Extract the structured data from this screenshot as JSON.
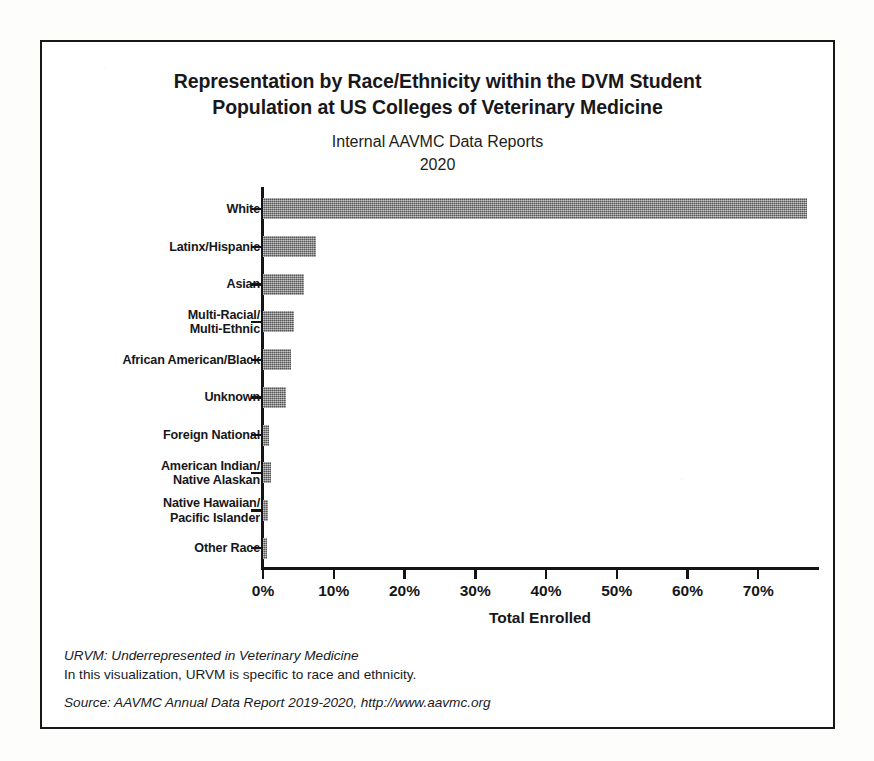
{
  "figure": {
    "title_lines": [
      "Representation by Race/Ethnicity within the DVM Student",
      "Population at US Colleges of Veterinary Medicine"
    ],
    "subtitle_lines": [
      "Internal AAVMC Data Reports",
      "2020"
    ],
    "footnotes": {
      "urvm_definition": "URVM: Underrepresented in Veterinary Medicine",
      "urvm_note": "In this visualization, URVM is specific to race and ethnicity.",
      "source": "Source: AAVMC Annual Data Report 2019-2020, http://www.aavmc.org"
    },
    "colors": {
      "bar_fill": "#8d8d8d",
      "axis": "#141417",
      "frame": "#17171a",
      "background": "#ffffff",
      "text": "#18181b"
    }
  },
  "chart_data": {
    "type": "bar",
    "orientation": "horizontal",
    "title": "Representation by Race/Ethnicity within the DVM Student Population at US Colleges of Veterinary Medicine",
    "subtitle": "Internal AAVMC Data Reports 2020",
    "xlabel": "Total Enrolled",
    "ylabel": "",
    "xlim": [
      0,
      78.6
    ],
    "xticks": [
      0,
      10,
      20,
      30,
      40,
      50,
      60,
      70
    ],
    "xtick_labels": [
      "0%",
      "10%",
      "20%",
      "30%",
      "40%",
      "50%",
      "60%",
      "70%"
    ],
    "grid": false,
    "legend": false,
    "value_suffix": "%",
    "categories": [
      "White",
      "Latinx/Hispanic",
      "Asian",
      "Multi-Racial/\nMulti-Ethnic",
      "African American/Black",
      "Unknown",
      "Foreign National",
      "American Indian/\nNative Alaskan",
      "Native Hawaiian/\nPacific Islander",
      "Other Race"
    ],
    "values": [
      76.9,
      7.5,
      5.8,
      4.4,
      3.9,
      3.2,
      0.9,
      1.1,
      0.7,
      0.6
    ],
    "bars": [
      {
        "label_lines": [
          "White"
        ],
        "value": 76.9
      },
      {
        "label_lines": [
          "Latinx/Hispanic"
        ],
        "value": 7.5
      },
      {
        "label_lines": [
          "Asian"
        ],
        "value": 5.8
      },
      {
        "label_lines": [
          "Multi-Racial/",
          "Multi-Ethnic"
        ],
        "value": 4.4
      },
      {
        "label_lines": [
          "African American/Black"
        ],
        "value": 3.9
      },
      {
        "label_lines": [
          "Unknown"
        ],
        "value": 3.2
      },
      {
        "label_lines": [
          "Foreign National"
        ],
        "value": 0.9
      },
      {
        "label_lines": [
          "American Indian/",
          "Native Alaskan"
        ],
        "value": 1.1
      },
      {
        "label_lines": [
          "Native Hawaiian/",
          "Pacific Islander"
        ],
        "value": 0.7
      },
      {
        "label_lines": [
          "Other Race"
        ],
        "value": 0.6
      }
    ]
  }
}
